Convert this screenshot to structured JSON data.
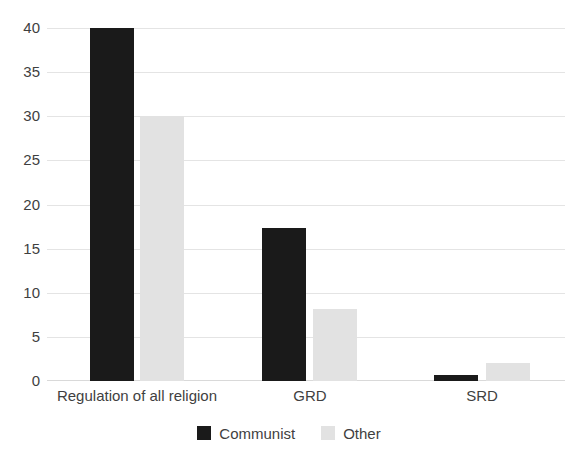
{
  "chart_data": {
    "type": "bar",
    "title": "",
    "subtitle": "",
    "xlabel": "",
    "ylabel": "",
    "categories": [
      "Regulation of all religion",
      "GRD",
      "SRD"
    ],
    "series": [
      {
        "name": "Communist",
        "color": "#1a1a1a",
        "values": [
          40,
          17.3,
          0.7
        ]
      },
      {
        "name": "Other",
        "color": "#e2e2e2",
        "values": [
          30,
          8.2,
          2
        ]
      }
    ],
    "ylim": [
      0,
      40
    ],
    "yticks": [
      0,
      5,
      10,
      15,
      20,
      25,
      30,
      35,
      40
    ],
    "ytick_labels": [
      "0",
      "5",
      "10",
      "15",
      "20",
      "25",
      "30",
      "35",
      "40"
    ],
    "grid": true,
    "grid_color": "#e4e4e4",
    "legend_position": "bottom",
    "annotations": []
  },
  "legend": {
    "entries": [
      {
        "label": "Communist",
        "color": "#1a1a1a"
      },
      {
        "label": "Other",
        "color": "#e2e2e2"
      }
    ]
  },
  "axis": {
    "y_tick_labels": [
      "40",
      "35",
      "30",
      "25",
      "20",
      "15",
      "10",
      "5",
      "0"
    ],
    "x_tick_labels": [
      "Regulation of all religion",
      "GRD",
      "SRD"
    ]
  },
  "colors": {
    "communist": "#1a1a1a",
    "other": "#e2e2e2",
    "gridline": "#e4e4e4",
    "text": "#3f3f3f",
    "background": "#ffffff"
  }
}
